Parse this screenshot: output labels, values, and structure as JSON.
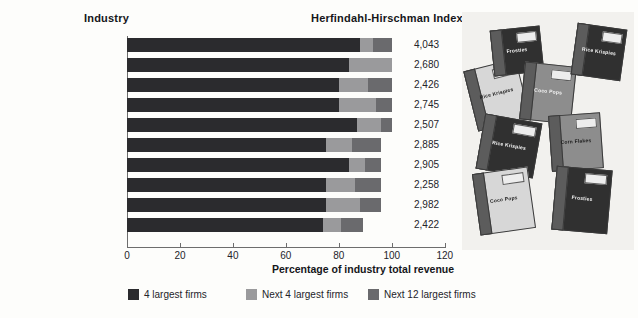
{
  "headers": {
    "industry": "Industry",
    "hhi": "Herfindahl-Hirschman Index"
  },
  "chart_data": {
    "type": "bar",
    "orientation": "horizontal",
    "stacked": true,
    "title": "",
    "xlabel": "Percentage of industry total revenue",
    "ylabel": "Industry",
    "xlim": [
      0,
      120
    ],
    "xticks": [
      0,
      20,
      40,
      60,
      80,
      100,
      120
    ],
    "xticklabels": [
      "0",
      "20",
      "40",
      "60",
      "80",
      "100",
      "120"
    ],
    "grid": false,
    "legend_position": "bottom",
    "categories": [
      "Airplanes*",
      "Light trucks",
      "Breakfast cereals",
      "Tobacco products",
      "Glass containers",
      "Specialty cans",
      "Recording devices",
      "Light bulbs",
      "Computer storage devices",
      "Airplane engines"
    ],
    "series": [
      {
        "name": "4 largest firms",
        "color": "#2b2b2e",
        "values": [
          88,
          84,
          80,
          80,
          87,
          75,
          84,
          75,
          75,
          74
        ]
      },
      {
        "name": "Next 4 largest firms",
        "color": "#9a9a9c",
        "values": [
          5,
          16,
          11,
          14,
          9,
          10,
          6,
          11,
          13,
          7
        ]
      },
      {
        "name": "Next 12 largest firms",
        "color": "#6a6a6d",
        "values": [
          7,
          0,
          9,
          6,
          4,
          11,
          6,
          10,
          8,
          8
        ]
      }
    ],
    "totals": [
      100,
      100,
      100,
      100,
      100,
      96,
      96,
      96,
      96,
      89
    ],
    "annotations": {
      "label": "Herfindahl-Hirschman Index",
      "values": [
        "4,043",
        "2,680",
        "2,426",
        "2,745",
        "2,507",
        "2,885",
        "2,905",
        "2,258",
        "2,982",
        "2,422"
      ]
    }
  },
  "photo": {
    "caption": "breakfast cereal boxes",
    "boxes": [
      {
        "brand": "Rice Krispies"
      },
      {
        "brand": "Frosties"
      },
      {
        "brand": "Coco Pops"
      },
      {
        "brand": "Rice Krispies"
      },
      {
        "brand": "Corn Flakes"
      },
      {
        "brand": "Rice Krispies"
      },
      {
        "brand": "Coco Pops"
      },
      {
        "brand": "Frosties"
      }
    ]
  }
}
